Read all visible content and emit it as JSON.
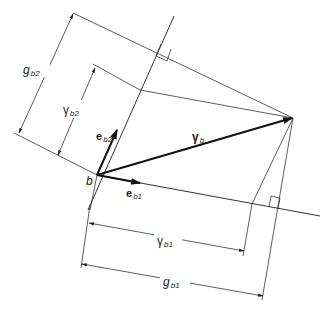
{
  "diagram": {
    "labels": {
      "origin": "b",
      "basis1": {
        "base": "e",
        "sub": "b1"
      },
      "basis2": {
        "base": "e",
        "sub": "b2"
      },
      "vector": {
        "base": "γ",
        "sub": "b"
      },
      "gamma_b1": {
        "base": "γ",
        "sub": "b1"
      },
      "gamma_b2": {
        "base": "γ",
        "sub": "b2"
      },
      "g_b1": {
        "base": "g",
        "sub": "b1"
      },
      "g_b2": {
        "base": "g",
        "sub": "b2"
      }
    },
    "colors": {
      "line": "#333333",
      "text": "#222222",
      "background": "#ffffff"
    }
  }
}
